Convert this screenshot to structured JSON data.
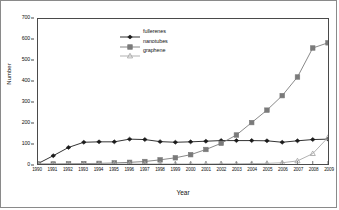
{
  "chart_data": {
    "type": "line",
    "title": "",
    "xlabel": "Year",
    "ylabel": "Number",
    "x": [
      1990,
      1991,
      1992,
      1993,
      1994,
      1995,
      1996,
      1997,
      1998,
      1999,
      2000,
      2001,
      2002,
      2003,
      2004,
      2005,
      2006,
      2007,
      2008,
      2009
    ],
    "xticklabels": [
      "1990",
      "1991",
      "1992",
      "1993",
      "1994",
      "1995",
      "1996",
      "1997",
      "1998",
      "1999",
      "2000",
      "2001",
      "2002",
      "2003",
      "2004",
      "2005",
      "2006",
      "2007",
      "2008",
      "2009"
    ],
    "ylim": [
      0,
      700
    ],
    "yticks": [
      0,
      100,
      200,
      300,
      400,
      500,
      600,
      700
    ],
    "yticklabels": [
      "0",
      "100",
      "200",
      "300",
      "400",
      "500",
      "600",
      "700"
    ],
    "grid": false,
    "legend_position": "upper-center",
    "series": [
      {
        "name": "fullerenes",
        "marker": "diamond",
        "color": "#1a1a1a",
        "values": [
          2,
          40,
          80,
          105,
          107,
          107,
          120,
          118,
          108,
          105,
          107,
          110,
          113,
          113,
          113,
          112,
          105,
          112,
          118,
          120
        ]
      },
      {
        "name": "nanotubes",
        "marker": "square",
        "color": "#7a7a7a",
        "values": [
          0,
          0,
          1,
          2,
          3,
          5,
          8,
          12,
          20,
          30,
          45,
          70,
          100,
          140,
          200,
          260,
          330,
          420,
          560,
          585
        ]
      },
      {
        "name": "graphene",
        "marker": "triangle",
        "color": "#a8a8a8",
        "values": [
          0,
          0,
          0,
          0,
          0,
          0,
          0,
          0,
          0,
          0,
          0,
          0,
          1,
          1,
          2,
          3,
          6,
          15,
          50,
          128
        ]
      }
    ]
  },
  "legend": {
    "items": [
      {
        "label": "fullerenes"
      },
      {
        "label": "nanotubes"
      },
      {
        "label": "graphene"
      }
    ]
  }
}
